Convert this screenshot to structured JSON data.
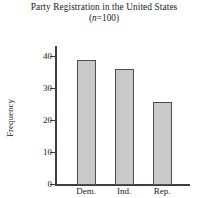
{
  "chart_data": {
    "type": "bar",
    "title": "Party Registration in the United States",
    "subtitle_prefix": "(",
    "subtitle_italic": "n",
    "subtitle_suffix": "=100)",
    "subtitle_full": "(n=100)",
    "xlabel": "",
    "ylabel": "Frequency",
    "categories": [
      "Dem.",
      "Ind.",
      "Rep."
    ],
    "values": [
      39,
      36,
      26
    ],
    "ylim": [
      0,
      43
    ],
    "yticks": [
      0,
      10,
      20,
      30,
      40
    ],
    "ytick_labels": [
      "0",
      "10",
      "20",
      "30",
      "40"
    ],
    "grid": false,
    "legend": false,
    "bar_fill_color": "#c9c9c9",
    "bar_edge_color": "#4d4d4d",
    "axis_color": "#3d3d3d"
  }
}
